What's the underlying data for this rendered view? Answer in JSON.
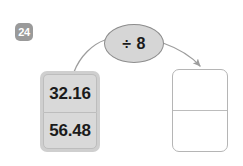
{
  "question": {
    "number_label": "24"
  },
  "operation": {
    "label": "÷ 8",
    "symbol_name": "division-sign",
    "divisor": "8",
    "fill_color": "#d6d6d6",
    "border_color": "#8d8d8d"
  },
  "input_card": {
    "name": "input-number-card",
    "fill_color": "#cfcfcf",
    "cells": [
      {
        "value": "32.16"
      },
      {
        "value": "56.48"
      }
    ]
  },
  "output_card": {
    "name": "answer-card",
    "fill_color": "#ffffff",
    "border_color": "#b5b5b5",
    "cells": [
      {
        "value": ""
      },
      {
        "value": ""
      }
    ]
  },
  "arrows": {
    "stroke_color": "#9d9d9d",
    "input_to_operation": {
      "name": "arrow-input-to-operation",
      "has_head": false
    },
    "operation_to_output": {
      "name": "arrow-operation-to-output",
      "has_head": true
    }
  },
  "palette": {
    "background": "#ffffff",
    "badge_bg": "#9a9a9a",
    "badge_text": "#ffffff",
    "text": "#1b1b1b"
  }
}
